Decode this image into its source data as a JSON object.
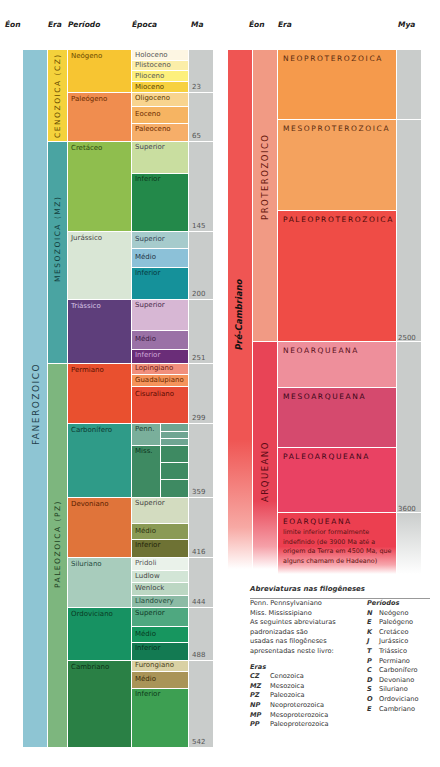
{
  "headers_left": {
    "eon": "Éon",
    "era": "Era",
    "period": "Período",
    "epoch": "Época",
    "ma": "Ma"
  },
  "headers_right": {
    "eon": "Éon",
    "era": "Era",
    "mya": "Mya"
  },
  "left_chart": {
    "eon": {
      "label": "FANEROZOICO",
      "color": "#8ec5d3"
    },
    "eras": [
      {
        "label": "CENOZOICA (CZ)",
        "color": "#f4d23c"
      },
      {
        "label": "MESOZOICA (MZ)",
        "color": "#4aa4a2"
      },
      {
        "label": "PALEOZOICA (PZ)",
        "color": "#7db67e"
      }
    ],
    "periods": [
      {
        "label": "Neógeno",
        "color": "#f7c532"
      },
      {
        "label": "Paleógeno",
        "color": "#f08d4f"
      },
      {
        "label": "Cretáceo",
        "color": "#8fbe4e"
      },
      {
        "label": "Jurássico",
        "color": "#d9e6d5"
      },
      {
        "label": "Triássico",
        "color": "#5e3e7b"
      },
      {
        "label": "Permiano",
        "color": "#e9502f"
      },
      {
        "label": "Carbonífero",
        "color": "#2f9b88"
      },
      {
        "label": "Devoniano",
        "color": "#e0743a"
      },
      {
        "label": "Siluriano",
        "color": "#a8ccbc"
      },
      {
        "label": "Ordoviciano",
        "color": "#179262"
      },
      {
        "label": "Cambriano",
        "color": "#2a8045"
      }
    ],
    "epochs": [
      {
        "label": "Holoceno",
        "color": "#fdf6e3"
      },
      {
        "label": "Plistoceno",
        "color": "#fbeea9"
      },
      {
        "label": "Plioceno",
        "color": "#fdf07c"
      },
      {
        "label": "Mioceno",
        "color": "#f7d140"
      },
      {
        "label": "Oligoceno",
        "color": "#f8d48f"
      },
      {
        "label": "Eoceno",
        "color": "#f6b462"
      },
      {
        "label": "Paleoceno",
        "color": "#f6ae69"
      },
      {
        "label": "Superior",
        "color": "#c9dea0"
      },
      {
        "label": "Inferior",
        "color": "#23894a"
      },
      {
        "label": "Superior",
        "color": "#a6cbcc"
      },
      {
        "label": "Médio",
        "color": "#8cc1d8"
      },
      {
        "label": "Inferior",
        "color": "#15919a"
      },
      {
        "label": "Superior",
        "color": "#d7b7d4"
      },
      {
        "label": "Médio",
        "color": "#9a71a6"
      },
      {
        "label": "Inferior",
        "color": "#6a2d78"
      },
      {
        "label": "Lopingiano",
        "color": "#f18f7c"
      },
      {
        "label": "Guadalupiano",
        "color": "#f5935b"
      },
      {
        "label": "Cisuraliano",
        "color": "#e74b35"
      },
      {
        "label": "Penn.",
        "color": "#7aaf9b"
      },
      {
        "label": "Miss.",
        "color": "#3e8a62"
      },
      {
        "label": "Superior",
        "color": "#d3dcc0"
      },
      {
        "label": "Médio",
        "color": "#8a9a55"
      },
      {
        "label": "Inferior",
        "color": "#6e7234"
      },
      {
        "label": "Pridoli",
        "color": "#eaf2ea"
      },
      {
        "label": "Ludlow",
        "color": "#d2e5d6"
      },
      {
        "label": "Wenlock",
        "color": "#bcd7c3"
      },
      {
        "label": "Llandovery",
        "color": "#8cbba5"
      },
      {
        "label": "Superior",
        "color": "#4fa880"
      },
      {
        "label": "Médio",
        "color": "#17965f"
      },
      {
        "label": "Inferior",
        "color": "#137a52"
      },
      {
        "label": "Furongiano",
        "color": "#d9d1a4"
      },
      {
        "label": "Médio",
        "color": "#a99458"
      },
      {
        "label": "Inferior",
        "color": "#3d9f52"
      }
    ],
    "ma_values": [
      "23",
      "65",
      "145",
      "200",
      "251",
      "299",
      "359",
      "416",
      "444",
      "488",
      "542"
    ]
  },
  "right_chart": {
    "eon": {
      "label": "Pré-Cambriano",
      "color": "#ef5553"
    },
    "sub_eons": [
      {
        "label": "PROTEROZOICO",
        "color": "#f19a84"
      },
      {
        "label": "ARQUEANO",
        "color": "#e84456"
      }
    ],
    "eras": [
      {
        "label": "NEOPROTEROZOICA",
        "color": "#f59a4c"
      },
      {
        "label": "MESOPROTEROZOICA",
        "color": "#f4a25e"
      },
      {
        "label": "PALEOPROTEROZOICA",
        "color": "#ef4c46"
      },
      {
        "label": "NEOARQUEANA",
        "color": "#ee8f9b"
      },
      {
        "label": "MESOARQUEANA",
        "color": "#d54a6e"
      },
      {
        "label": "PALEOARQUEANA",
        "color": "#e94263"
      },
      {
        "label": "EOARQUEANA",
        "color": "#ec3f50"
      }
    ],
    "eoarqueana_note": "limite inferior formalmente indefinido (de 3900 Ma até a origem da Terra em 4500 Ma, que alguns chamam de Hadeano)",
    "mya_values": [
      "2500",
      "3600"
    ]
  },
  "legend": {
    "title": "Abreviaturas nas filogêneses",
    "intro": [
      "Penn. Pennsylvaniano",
      "Miss. Mississipiano",
      "As seguintes abreviaturas",
      "padronizadas são",
      "usadas nas filogêneses",
      "apresentadas neste livro:"
    ],
    "eras_title": "Eras",
    "eras": [
      {
        "abbr": "CZ",
        "name": "Cenozoica"
      },
      {
        "abbr": "MZ",
        "name": "Mesozoica"
      },
      {
        "abbr": "PZ",
        "name": "Paleozoica"
      },
      {
        "abbr": "NP",
        "name": "Neoproterozoica"
      },
      {
        "abbr": "MP",
        "name": "Mesoproterozoica"
      },
      {
        "abbr": "PP",
        "name": "Paleoproterozoica"
      }
    ],
    "periods_title": "Períodos",
    "periods": [
      {
        "abbr": "N",
        "name": "Neógeno"
      },
      {
        "abbr": "E",
        "name": "Paleógeno"
      },
      {
        "abbr": "K",
        "name": "Cretáceo"
      },
      {
        "abbr": "J",
        "name": "Jurássico"
      },
      {
        "abbr": "T",
        "name": "Triássico"
      },
      {
        "abbr": "P",
        "name": "Permiano"
      },
      {
        "abbr": "C",
        "name": "Carbonífero"
      },
      {
        "abbr": "D",
        "name": "Devoniano"
      },
      {
        "abbr": "S",
        "name": "Siluriano"
      },
      {
        "abbr": "O",
        "name": "Ordoviciano"
      },
      {
        "abbr": "E",
        "name": "Cambriano"
      }
    ]
  }
}
